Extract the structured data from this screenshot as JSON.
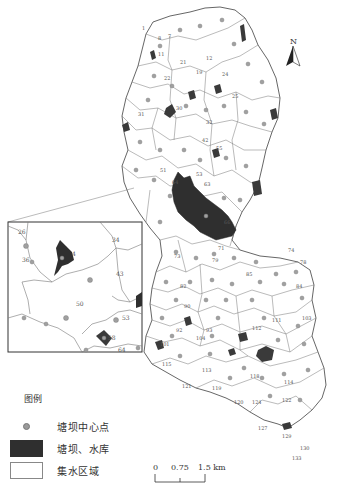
{
  "map": {
    "title": "",
    "north_arrow": {
      "label": "N"
    },
    "legend": {
      "title": "图例",
      "items": [
        {
          "symbol": "dot",
          "label": "塘坝中心点"
        },
        {
          "symbol": "dark-fill",
          "label": "塘坝、水库",
          "color": "#2f2f2f"
        },
        {
          "symbol": "white-fill",
          "label": "集水区域",
          "color": "#ffffff"
        }
      ]
    },
    "scale_bar": {
      "ticks": [
        "0",
        "0.75",
        "1.5 km"
      ]
    },
    "inset": {
      "zone_labels": [
        "26",
        "36",
        "4",
        "34",
        "43",
        "50",
        "53",
        "58",
        "64"
      ]
    },
    "zone_labels": [
      "1",
      "7",
      "8",
      "11",
      "12",
      "15",
      "19",
      "21",
      "22",
      "24",
      "25",
      "27",
      "30",
      "31",
      "32",
      "36",
      "37",
      "40",
      "42",
      "43",
      "45",
      "51",
      "55",
      "57",
      "61",
      "63",
      "64",
      "65",
      "66",
      "71",
      "72",
      "73",
      "74",
      "78",
      "79",
      "80",
      "82",
      "85",
      "86",
      "90",
      "92",
      "93",
      "94",
      "95",
      "101",
      "104",
      "105",
      "106",
      "107",
      "109",
      "111",
      "112",
      "113",
      "114",
      "115",
      "118",
      "119",
      "120",
      "121",
      "122",
      "123",
      "124",
      "125",
      "126",
      "127",
      "128",
      "129",
      "130",
      "131",
      "133"
    ]
  }
}
